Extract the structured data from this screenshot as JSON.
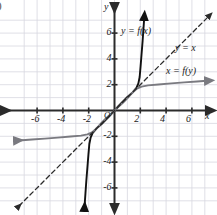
{
  "figure": {
    "item_tag": ")",
    "axis_labels": {
      "x": "x",
      "y": "y"
    },
    "origin_label": "O"
  },
  "labels": {
    "f_of_x": "y = f(x)",
    "y_equals_x": "y = x",
    "x_of_f_y": "x = f(y)"
  },
  "colors": {
    "grid": "#d8d8e0",
    "axis": "#2b2b2b",
    "curve_black": "#111111",
    "curve_gray": "#7a7a80",
    "dashed": "#2b2b2b",
    "background": "#ffffff"
  },
  "chart_data": {
    "type": "line",
    "title": "",
    "xlabel": "x",
    "ylabel": "y",
    "xlim": [
      -7.5,
      7.5
    ],
    "ylim": [
      -7.5,
      7.5
    ],
    "grid": true,
    "grid_step": 1,
    "legend": "inline-annotations",
    "xticks": [
      -6,
      -4,
      -2,
      2,
      4,
      6
    ],
    "xtick_labels": [
      "-6",
      "-4",
      "-2",
      "2",
      "4",
      "6"
    ],
    "yticks": [
      6,
      4,
      2,
      -2,
      -4,
      -6
    ],
    "ytick_labels": [
      "6",
      "4",
      "2",
      "-2",
      "-4",
      "-6"
    ],
    "series": [
      {
        "name": "y = f(x)",
        "color": "#111111",
        "style": "solid",
        "arrows": [
          "start",
          "end"
        ],
        "description": "Increasing cubic-like curve through (-2,-2), (0,0), (2,2); steep outside [-2,2]",
        "points": [
          [
            -2.32,
            -7.4
          ],
          [
            -2.25,
            -6.4
          ],
          [
            -2.18,
            -5.4
          ],
          [
            -2.1,
            -4.4
          ],
          [
            -2.02,
            -3.4
          ],
          [
            -1.95,
            -2.6
          ],
          [
            -1.85,
            -2.1
          ],
          [
            -1.7,
            -1.75
          ],
          [
            -1.4,
            -1.4
          ],
          [
            -1.0,
            -1.05
          ],
          [
            -0.6,
            -0.65
          ],
          [
            -0.3,
            -0.33
          ],
          [
            0,
            0
          ],
          [
            0.3,
            0.33
          ],
          [
            0.6,
            0.65
          ],
          [
            1.0,
            1.05
          ],
          [
            1.4,
            1.4
          ],
          [
            1.7,
            1.75
          ],
          [
            1.85,
            2.1
          ],
          [
            1.95,
            2.6
          ],
          [
            2.02,
            3.4
          ],
          [
            2.1,
            4.4
          ],
          [
            2.18,
            5.4
          ],
          [
            2.25,
            6.4
          ],
          [
            2.32,
            7.4
          ]
        ]
      },
      {
        "name": "x = f(y)",
        "color": "#7a7a80",
        "style": "solid",
        "arrows": [
          "start",
          "end"
        ],
        "description": "Reflection of y = f(x) across the line y = x; flat outside [-2,2]",
        "points": [
          [
            -7.4,
            -2.32
          ],
          [
            -6.4,
            -2.25
          ],
          [
            -5.4,
            -2.18
          ],
          [
            -4.4,
            -2.1
          ],
          [
            -3.4,
            -2.02
          ],
          [
            -2.6,
            -1.95
          ],
          [
            -2.1,
            -1.85
          ],
          [
            -1.75,
            -1.7
          ],
          [
            -1.4,
            -1.4
          ],
          [
            -1.05,
            -1.0
          ],
          [
            -0.65,
            -0.6
          ],
          [
            -0.33,
            -0.3
          ],
          [
            0,
            0
          ],
          [
            0.33,
            0.3
          ],
          [
            0.65,
            0.6
          ],
          [
            1.05,
            1.0
          ],
          [
            1.4,
            1.4
          ],
          [
            1.75,
            1.7
          ],
          [
            2.1,
            1.85
          ],
          [
            2.6,
            1.95
          ],
          [
            3.4,
            2.02
          ],
          [
            4.4,
            2.1
          ],
          [
            5.4,
            2.18
          ],
          [
            6.4,
            2.25
          ],
          [
            7.4,
            2.32
          ]
        ]
      },
      {
        "name": "y = x",
        "color": "#2b2b2b",
        "style": "dashed",
        "arrows": [
          "start",
          "end"
        ],
        "description": "Line of symmetry / reflection axis",
        "points": [
          [
            -7.4,
            -7.4
          ],
          [
            7.4,
            7.4
          ]
        ]
      }
    ],
    "annotations": [
      {
        "text": "y = f(x)",
        "x": 0.55,
        "y": 6.0
      },
      {
        "text": "y = x",
        "x": 5.2,
        "y": 4.45
      },
      {
        "text": "x = f(y)",
        "x": 4.6,
        "y": 2.6
      }
    ],
    "intersections": [
      [
        -2,
        -2
      ],
      [
        0,
        0
      ],
      [
        2,
        2
      ]
    ]
  }
}
